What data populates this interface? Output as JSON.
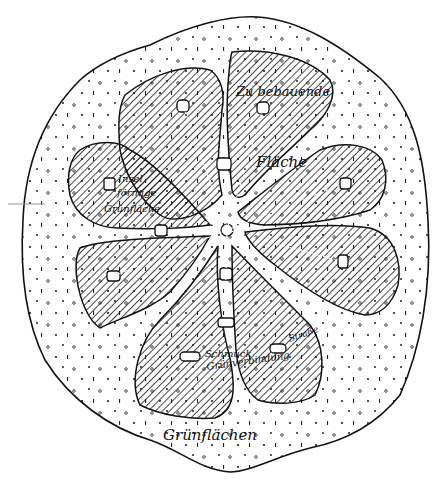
{
  "diagram": {
    "type": "urban-plan-sketch",
    "style": "black-and-white line drawing",
    "colors": {
      "ink": "#111111",
      "paper": "#ffffff",
      "hatch": "#1a1a1a"
    },
    "labels": {
      "built_area_line1": "Zu bebauende",
      "built_area_line2": "Fläche",
      "island_line1": "Insel",
      "island_line2": "förmige",
      "island_line3": "Grünfläche",
      "ornamental_line1": "Schmuck",
      "ornamental_line2": "Grünverbindung",
      "street": "Straße",
      "green_areas": "Grünflächen"
    },
    "legend": {
      "hatched": "Zu bebauende Fläche",
      "dotted": "Grünflächen"
    }
  }
}
